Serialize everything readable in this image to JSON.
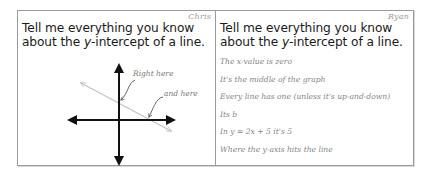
{
  "prompt": {
    "part1": "Tell me everything you know about the ",
    "variable": "y",
    "part2": "-intercept of a line."
  },
  "left_card": {
    "author": "Chris",
    "annotations": {
      "first": "Right here",
      "second": "and here"
    }
  },
  "right_card": {
    "author": "Ryan",
    "answers": [
      "The x-value is zero",
      "It's the middle of the graph",
      "Every line has one (unless it's up-and-down)",
      "Its b",
      "In y = 2x + 5 it's 5",
      "Where the y-axis hits the line"
    ]
  },
  "colors": {
    "border": "#9a9a9a",
    "axes": "#111111",
    "line": "#c4c4c4",
    "handwriting": "#858585"
  }
}
